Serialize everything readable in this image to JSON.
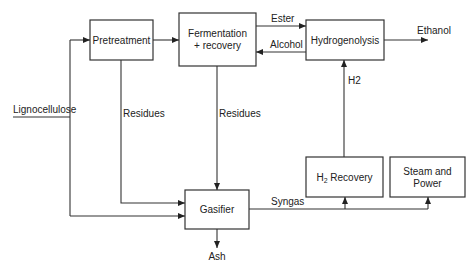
{
  "diagram": {
    "nodes": {
      "pretreatment": {
        "label": "Pretreatment"
      },
      "fermentation": {
        "line1": "Fermentation",
        "line2": "+ recovery"
      },
      "hydrogenolysis": {
        "label": "Hydrogenolysis"
      },
      "h2_recovery": {
        "main": "H",
        "sub": "2",
        "rest": " Recovery"
      },
      "steam_power": {
        "line1": "Steam and",
        "line2": "Power"
      },
      "gasifier": {
        "label": "Gasifier"
      }
    },
    "edges": {
      "feed": "Lignocellulose",
      "ester": "Ester",
      "alcohol": "Alcohol",
      "ethanol": "Ethanol",
      "h2": "H2",
      "residues_pretreatment": "Residues",
      "residues_fermentation": "Residues",
      "syngas": "Syngas",
      "ash": "Ash"
    }
  }
}
